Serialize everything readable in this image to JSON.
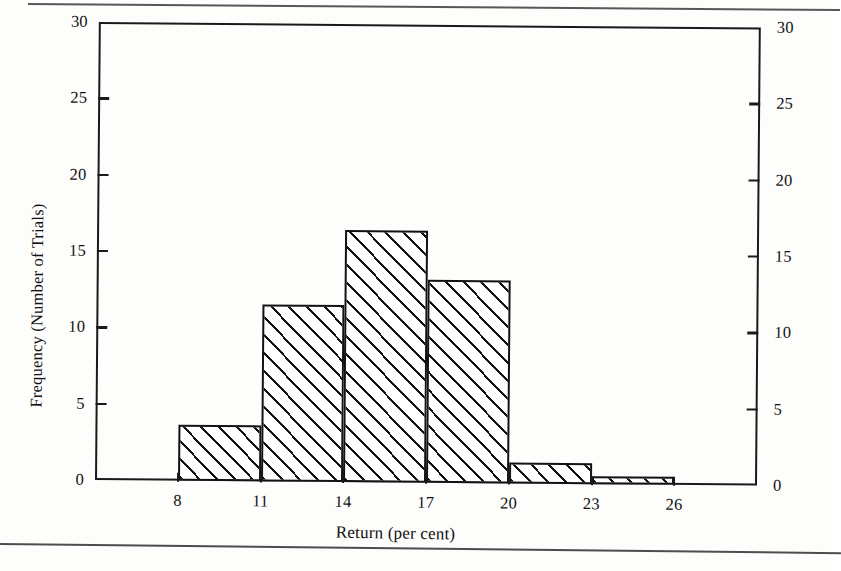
{
  "figure": {
    "axis_titles": {
      "y": "Frequency (Number of Trials)",
      "x": "Return (per cent)"
    }
  },
  "chart_data": {
    "type": "bar",
    "subtype": "histogram",
    "title": "",
    "xlabel": "Return (per cent)",
    "ylabel": "Frequency (Number of Trials)",
    "xlim": [
      5,
      29
    ],
    "ylim": [
      0,
      30
    ],
    "grid": false,
    "legend": null,
    "bin_width": 3,
    "bin_edges": [
      8,
      11,
      14,
      17,
      20,
      23,
      26
    ],
    "categories": [
      "8-11",
      "11-14",
      "14-17",
      "17-20",
      "20-23",
      "23-26"
    ],
    "values": [
      3.7,
      11.6,
      16.5,
      13.3,
      1.4,
      0.5
    ],
    "x_tick_labels": [
      "8",
      "11",
      "14",
      "17",
      "20",
      "23",
      "26"
    ],
    "x_tick_values": [
      8,
      11,
      14,
      17,
      20,
      23,
      26
    ],
    "y_tick_labels_left": [
      "30",
      "25",
      "20",
      "15",
      "10",
      "5",
      "0"
    ],
    "y_tick_labels_right": [
      "30",
      "25",
      "20",
      "15",
      "10",
      "5",
      "0"
    ],
    "y_tick_values": [
      30,
      25,
      20,
      15,
      10,
      5,
      0
    ],
    "bar_fill": "diagonal-hatch",
    "bar_edge_color": "#121212",
    "background_color": "#ffffff"
  }
}
